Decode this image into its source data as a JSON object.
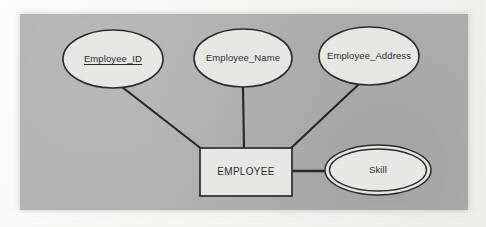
{
  "diagram": {
    "panel_color": "#b2b2b2",
    "line_color": "#262626",
    "shape_fill": "#e9e9e7",
    "shape_stroke": "#2b2b2b",
    "entity": {
      "id": "employee",
      "label": "EMPLOYEE",
      "shape": "rectangle",
      "x": 200,
      "y": 148,
      "width": 92,
      "height": 48
    },
    "attributes": [
      {
        "id": "employee-id",
        "label": "Employee_ID",
        "shape": "ellipse",
        "key": true,
        "multivalued": false,
        "cx": 113,
        "cy": 59,
        "rx": 50,
        "ry": 29
      },
      {
        "id": "employee-name",
        "label": "Employee_Name",
        "shape": "ellipse",
        "key": false,
        "multivalued": false,
        "cx": 243,
        "cy": 58,
        "rx": 49,
        "ry": 29
      },
      {
        "id": "employee-address",
        "label": "Employee_Address",
        "shape": "ellipse",
        "key": false,
        "multivalued": false,
        "cx": 369,
        "cy": 56,
        "rx": 50,
        "ry": 29
      },
      {
        "id": "skill",
        "label": "Skill",
        "shape": "double-ellipse",
        "key": false,
        "multivalued": true,
        "cx": 378,
        "cy": 170,
        "rx": 53,
        "ry": 25
      }
    ],
    "connectors": [
      {
        "id": "employee-id-to-employee",
        "from": "employee-id",
        "to": "employee",
        "x1": 122,
        "y1": 87,
        "x2": 203,
        "y2": 150
      },
      {
        "id": "employee-name-to-employee",
        "from": "employee-name",
        "to": "employee",
        "x1": 243,
        "y1": 87,
        "x2": 244,
        "y2": 148
      },
      {
        "id": "employee-address-to-employee",
        "from": "employee-address",
        "to": "employee",
        "x1": 358,
        "y1": 85,
        "x2": 290,
        "y2": 149
      },
      {
        "id": "employee-to-skill",
        "from": "employee",
        "to": "skill",
        "x1": 292,
        "y1": 171,
        "x2": 326,
        "y2": 171
      }
    ]
  }
}
